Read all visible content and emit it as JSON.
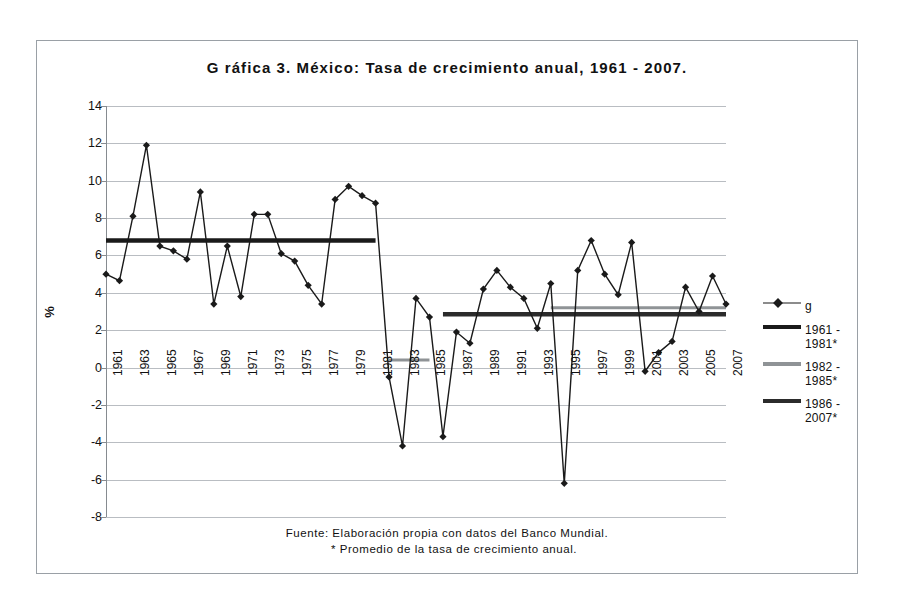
{
  "chart_data": {
    "type": "line",
    "title": "G ráfica 3. México: Tasa de crecimiento anual, 1961 - 2007.",
    "xlabel": "",
    "ylabel": "%",
    "ylim": [
      -8,
      14
    ],
    "ytick_step": 2,
    "yticks": [
      14,
      12,
      10,
      8,
      6,
      4,
      2,
      0,
      -2,
      -4,
      -6,
      -8
    ],
    "grid": true,
    "legend_position": "right",
    "x": [
      1961,
      1962,
      1963,
      1964,
      1965,
      1966,
      1967,
      1968,
      1969,
      1970,
      1971,
      1972,
      1973,
      1974,
      1975,
      1976,
      1977,
      1978,
      1979,
      1980,
      1981,
      1982,
      1983,
      1984,
      1985,
      1986,
      1987,
      1988,
      1989,
      1990,
      1991,
      1992,
      1993,
      1994,
      1995,
      1996,
      1997,
      1998,
      1999,
      2000,
      2001,
      2002,
      2003,
      2004,
      2005,
      2006,
      2007
    ],
    "xtick_labels": [
      "1961",
      "1963",
      "1965",
      "1967",
      "1969",
      "1971",
      "1973",
      "1975",
      "1977",
      "1979",
      "1981",
      "1983",
      "1985",
      "1987",
      "1989",
      "1991",
      "1993",
      "1995",
      "1997",
      "1999",
      "2001",
      "2003",
      "2005",
      "2007"
    ],
    "series": [
      {
        "name": "g",
        "marker": "diamond",
        "color": "#1a1a1a",
        "values": [
          5.0,
          4.65,
          8.1,
          11.9,
          6.5,
          6.25,
          5.8,
          9.4,
          3.4,
          6.5,
          3.8,
          8.2,
          8.2,
          6.1,
          5.7,
          4.4,
          3.4,
          9.0,
          9.7,
          9.2,
          8.8,
          -0.5,
          -4.2,
          3.7,
          2.7,
          -3.7,
          1.9,
          1.3,
          4.2,
          5.2,
          4.3,
          3.7,
          2.1,
          4.5,
          -6.2,
          5.2,
          6.8,
          5.0,
          3.9,
          6.7,
          -0.2,
          0.8,
          1.4,
          4.3,
          3.0,
          4.9,
          3.4
        ]
      },
      {
        "name": "1961 - 1981*",
        "type": "average-segment",
        "color": "#1a1a1a",
        "x_start": 1961,
        "x_end": 1981,
        "value": 6.8
      },
      {
        "name": "1982 - 1985*",
        "type": "average-segment",
        "color": "#8f9396",
        "x_start": 1982,
        "x_end": 1985,
        "value": 0.4
      },
      {
        "name": "1986 - 2007*",
        "type": "average-segment",
        "color": "#2b2b2b",
        "x_start": 1986,
        "x_end": 2007,
        "value": 2.85
      },
      {
        "name": "1986 - 2007* overlay",
        "type": "average-segment",
        "color": "#8f9396",
        "x_start": 1994,
        "x_end": 2007,
        "value": 3.2
      }
    ],
    "legend": [
      {
        "label": "g",
        "swatch": "diamond-line",
        "color": "#1a1a1a"
      },
      {
        "label": "1961 - 1981*",
        "swatch": "line",
        "color": "#1a1a1a"
      },
      {
        "label": "1982 - 1985*",
        "swatch": "line",
        "color": "#8f9396"
      },
      {
        "label": "1986 - 2007*",
        "swatch": "line",
        "color": "#2b2b2b"
      }
    ],
    "footnote_line1": "Fuente: Elaboración propia con datos del Banco Mundial.",
    "footnote_line2": "* Promedio de la tasa de crecimiento anual."
  }
}
